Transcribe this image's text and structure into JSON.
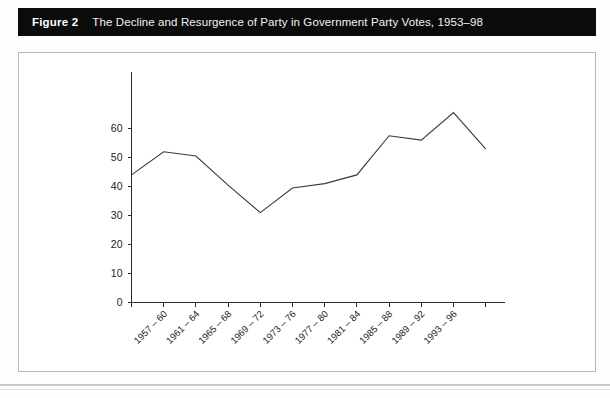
{
  "header": {
    "figure_label": "Figure 2",
    "caption": "The Decline and Resurgence of Party in Government Party Votes, 1953–98"
  },
  "chart_data": {
    "type": "line",
    "title": "The Decline and Resurgence of Party in Government Party Votes, 1953–98",
    "xlabel": "",
    "ylabel": "",
    "categories": [
      "1953 – 56",
      "1957 – 60",
      "1961 – 64",
      "1965 – 68",
      "1969 – 72",
      "1973 – 76",
      "1977 – 80",
      "1981 – 84",
      "1985 – 88",
      "1989 – 92",
      "1993 – 96",
      "1997 – 98"
    ],
    "visible_tick_labels": [
      "1957 – 60",
      "1961 – 64",
      "1965 – 68",
      "1969 – 72",
      "1973 – 76",
      "1977 – 80",
      "1981 – 84",
      "1985 – 88",
      "1989 – 92",
      "1993 – 96"
    ],
    "values": [
      44,
      52,
      50.5,
      40.5,
      31,
      39.5,
      41,
      44,
      57.5,
      56,
      65.5,
      53
    ],
    "yticks": [
      0,
      10,
      20,
      30,
      40,
      50,
      60
    ],
    "ytick_labels": [
      "0",
      "10",
      "20",
      "30",
      "40",
      "50",
      "60"
    ],
    "ylim": [
      0,
      68
    ],
    "grid": false,
    "legend": "none",
    "line_color": "#3a3a3a",
    "axis_color": "#2b2b2b"
  },
  "colors": {
    "title_bar_background": "#0b0b0b",
    "title_text": "#ffffff",
    "panel_background": "#ffffff",
    "panel_border": "#b9b9b9",
    "page_background": "#fdfdfb"
  }
}
